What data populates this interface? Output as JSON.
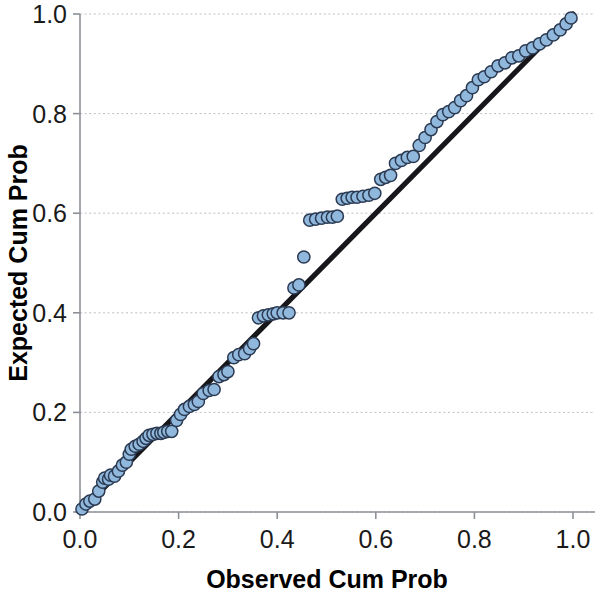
{
  "chart_data": {
    "type": "scatter",
    "title": "",
    "subtitle": "",
    "xlabel": "Observed Cum Prob",
    "ylabel": "Expected Cum Prob",
    "xlim": [
      0.0,
      1.0
    ],
    "ylim": [
      0.0,
      1.0
    ],
    "xticks": [
      "0.0",
      "0.2",
      "0.4",
      "0.6",
      "0.8",
      "1.0"
    ],
    "yticks": [
      "0.0",
      "0.2",
      "0.4",
      "0.6",
      "0.8",
      "1.0"
    ],
    "xtick_values": [
      0.0,
      0.2,
      0.4,
      0.6,
      0.8,
      1.0
    ],
    "ytick_values": [
      0.0,
      0.2,
      0.4,
      0.6,
      0.8,
      1.0
    ],
    "grid": "horizontal-dotted",
    "legend": "none",
    "marker_color": "#8fb8dc",
    "marker_edge_color": "#2b3a52",
    "reference_line_color": "#17161a",
    "axis_color": "#8d9096",
    "gridline_color": "#b9bcc2",
    "reference_line": {
      "name": "identity line",
      "x": [
        0.0,
        1.0
      ],
      "y": [
        0.0,
        1.0
      ]
    },
    "series": [
      {
        "name": "Normal P-P points",
        "x": [
          0.004,
          0.012,
          0.02,
          0.03,
          0.038,
          0.046,
          0.05,
          0.058,
          0.062,
          0.07,
          0.078,
          0.086,
          0.094,
          0.1,
          0.104,
          0.112,
          0.12,
          0.128,
          0.134,
          0.14,
          0.148,
          0.156,
          0.164,
          0.17,
          0.178,
          0.186,
          0.196,
          0.204,
          0.212,
          0.222,
          0.232,
          0.24,
          0.25,
          0.262,
          0.272,
          0.282,
          0.292,
          0.3,
          0.312,
          0.322,
          0.334,
          0.344,
          0.352,
          0.362,
          0.372,
          0.382,
          0.392,
          0.4,
          0.412,
          0.424,
          0.434,
          0.444,
          0.454,
          0.466,
          0.478,
          0.49,
          0.502,
          0.512,
          0.522,
          0.532,
          0.542,
          0.552,
          0.562,
          0.574,
          0.586,
          0.598,
          0.61,
          0.62,
          0.63,
          0.64,
          0.652,
          0.664,
          0.676,
          0.688,
          0.7,
          0.712,
          0.724,
          0.736,
          0.748,
          0.76,
          0.772,
          0.784,
          0.796,
          0.808,
          0.82,
          0.834,
          0.848,
          0.862,
          0.876,
          0.89,
          0.904,
          0.918,
          0.932,
          0.946,
          0.96,
          0.974,
          0.986,
          0.996
        ],
        "y": [
          0.006,
          0.016,
          0.022,
          0.026,
          0.042,
          0.06,
          0.068,
          0.066,
          0.074,
          0.072,
          0.082,
          0.094,
          0.1,
          0.116,
          0.126,
          0.132,
          0.136,
          0.142,
          0.148,
          0.154,
          0.156,
          0.158,
          0.158,
          0.16,
          0.162,
          0.162,
          0.184,
          0.196,
          0.206,
          0.212,
          0.216,
          0.222,
          0.238,
          0.244,
          0.246,
          0.272,
          0.276,
          0.282,
          0.31,
          0.316,
          0.318,
          0.328,
          0.338,
          0.39,
          0.394,
          0.396,
          0.398,
          0.4,
          0.4,
          0.4,
          0.45,
          0.456,
          0.512,
          0.586,
          0.588,
          0.59,
          0.592,
          0.592,
          0.594,
          0.628,
          0.63,
          0.632,
          0.632,
          0.634,
          0.636,
          0.64,
          0.668,
          0.672,
          0.676,
          0.7,
          0.706,
          0.712,
          0.714,
          0.736,
          0.752,
          0.768,
          0.784,
          0.798,
          0.804,
          0.812,
          0.826,
          0.836,
          0.852,
          0.868,
          0.874,
          0.884,
          0.896,
          0.902,
          0.912,
          0.916,
          0.926,
          0.932,
          0.94,
          0.948,
          0.958,
          0.968,
          0.98,
          0.992
        ]
      }
    ]
  }
}
